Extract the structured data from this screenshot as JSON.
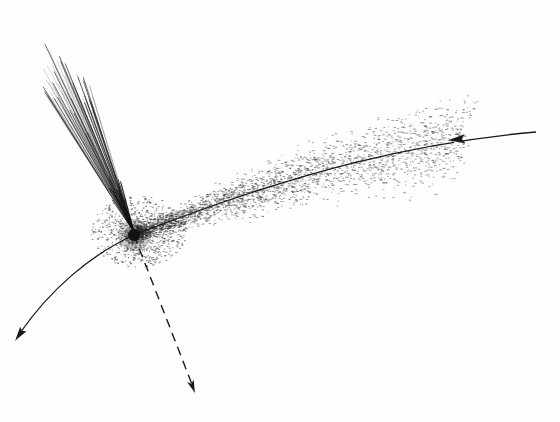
{
  "diagram": {
    "background": "#fefefe",
    "ink": "#1a1a1a",
    "nucleus": {
      "cx": 134,
      "cy": 235,
      "r": 6,
      "color": "#111111"
    },
    "coma": {
      "cx": 138,
      "cy": 232,
      "rx": 48,
      "ry": 36,
      "dot_count": 900
    },
    "ion_tail": {
      "apex": [
        134,
        232
      ],
      "streak_count": 70,
      "spread_from": [
        42,
        135
      ],
      "spread_to": [
        40,
        95
      ],
      "color": "#555555"
    },
    "dust_tail": {
      "dot_count": 2600,
      "extent_x": [
        140,
        470
      ],
      "color": "#333333"
    },
    "orbit": {
      "path": "M 536 132 C 420 142, 300 170, 134 235 C 90 255, 50 290, 20 333",
      "gap_at": [
        456,
        139
      ],
      "incoming_arrow": {
        "x": 462,
        "y": 139,
        "angle": 175
      },
      "outgoing_arrow": {
        "x": 22,
        "y": 331,
        "angle": 125
      }
    },
    "dashed_direction": {
      "from": [
        134,
        235
      ],
      "to": [
        195,
        393
      ],
      "dash": "9 6",
      "arrow": {
        "x": 195,
        "y": 393,
        "angle": 69
      }
    }
  }
}
